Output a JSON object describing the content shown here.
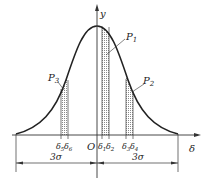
{
  "diagram": {
    "type": "normal-distribution",
    "axes": {
      "y_label": "y",
      "x_label": "δ",
      "origin_label": "O"
    },
    "regions": [
      {
        "name": "P1",
        "label": "P",
        "sub": "1",
        "from": "δ1",
        "to": "δ2"
      },
      {
        "name": "P2",
        "label": "P",
        "sub": "2",
        "from": "δ3",
        "to": "δ4"
      },
      {
        "name": "P3",
        "label": "P",
        "sub": "3",
        "from": "δ5",
        "to": "δ6"
      }
    ],
    "ticks": {
      "d1": {
        "base": "δ",
        "sub": "1"
      },
      "d2": {
        "base": "δ",
        "sub": "2"
      },
      "d3": {
        "base": "δ",
        "sub": "3"
      },
      "d4": {
        "base": "δ",
        "sub": "4"
      },
      "d5": {
        "base": "δ",
        "sub": "5"
      },
      "d6": {
        "base": "δ",
        "sub": "6"
      }
    },
    "dimensions": {
      "left": "3σ",
      "right": "3σ"
    },
    "colors": {
      "line": "#222222",
      "shade": "#9a9a9a"
    }
  }
}
